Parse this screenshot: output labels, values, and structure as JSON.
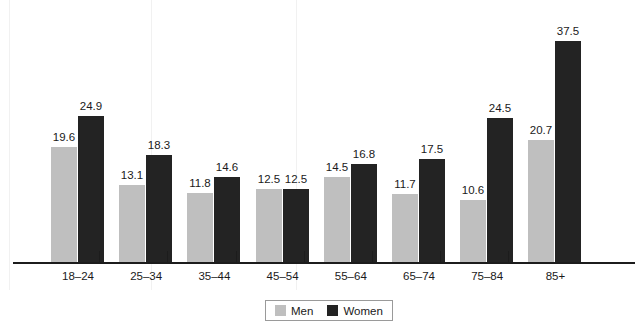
{
  "chart_data": {
    "type": "bar",
    "title": "",
    "subtitle": "",
    "xlabel": "",
    "ylabel": "",
    "grid": false,
    "legend_position": "bottom-center",
    "ylim": [
      0,
      37.5
    ],
    "categories": [
      "18–24",
      "25–34",
      "35–44",
      "45–54",
      "55–64",
      "65–74",
      "75–84",
      "85+"
    ],
    "series": [
      {
        "name": "Men",
        "color": "#bfbfbf",
        "values": [
          19.6,
          13.1,
          11.8,
          12.5,
          14.5,
          11.7,
          10.6,
          20.7
        ],
        "labels": [
          "19.6",
          "13.1",
          "11.8",
          "12.5",
          "14.5",
          "11.7",
          "10.6",
          "20.7"
        ]
      },
      {
        "name": "Women",
        "color": "#232323",
        "values": [
          24.9,
          18.3,
          14.6,
          12.5,
          16.8,
          17.5,
          24.5,
          37.5
        ],
        "labels": [
          "24.9",
          "18.3",
          "14.6",
          "12.5",
          "16.8",
          "17.5",
          "24.5",
          "37.5"
        ]
      }
    ]
  },
  "legend": {
    "items": [
      {
        "label": "Men",
        "swatch": "men"
      },
      {
        "label": "Women",
        "swatch": "women"
      }
    ]
  },
  "axis": {
    "tick_labels": [
      "18–24",
      "25–34",
      "35–44",
      "45–54",
      "55–64",
      "65–74",
      "75–84",
      "85+"
    ]
  },
  "colors": {
    "men": "#bfbfbf",
    "women": "#232323",
    "axis": "#1c1c1c",
    "text": "#1a1a1a",
    "background": "#ffffff"
  }
}
